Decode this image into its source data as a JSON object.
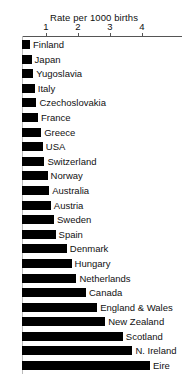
{
  "chart_data": {
    "type": "bar",
    "orientation": "horizontal",
    "title": "Rate per 1000 births",
    "xlabel": "Rate per 1000 births",
    "ylabel": "",
    "xlim": [
      0,
      4.6
    ],
    "grid": false,
    "legend": null,
    "tick_labels": [
      "1",
      "2",
      "3",
      "4"
    ],
    "tick_values": [
      1,
      2,
      3,
      4
    ],
    "bar_color": "#000000",
    "categories": [
      "Finland",
      "Japan",
      "Yugoslavia",
      "Italy",
      "Czechoslovakia",
      "France",
      "Greece",
      "USA",
      "Switzerland",
      "Norway",
      "Australia",
      "Austria",
      "Sweden",
      "Spain",
      "Denmark",
      "Hungary",
      "Netherlands",
      "Canada",
      "England & Wales",
      "New Zealand",
      "Scotland",
      "N. Ireland",
      "Eire"
    ],
    "values": [
      0.5,
      0.55,
      0.6,
      0.65,
      0.7,
      0.75,
      0.85,
      0.9,
      0.95,
      1.05,
      1.1,
      1.15,
      1.25,
      1.3,
      1.65,
      1.8,
      1.95,
      2.25,
      2.6,
      2.85,
      3.4,
      3.7,
      4.25
    ]
  }
}
